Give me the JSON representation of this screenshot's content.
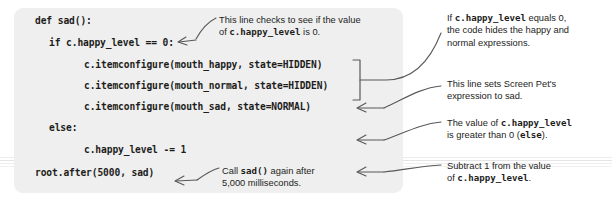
{
  "figure": {
    "type": "annotated-code-listing",
    "background_color": "#ffffff",
    "code_panel_color": "#efefef",
    "text_color": "#1d1d1b"
  },
  "code": {
    "language": "python",
    "lines": [
      "def sad():",
      "    if c.happy_level == 0:",
      "        c.itemconfigure(mouth_happy, state=HIDDEN)",
      "        c.itemconfigure(mouth_normal, state=HIDDEN)",
      "        c.itemconfigure(mouth_sad, state=NORMAL)",
      "    else:",
      "        c.happy_level -= 1",
      "    root.after(5000, sad)"
    ],
    "line1": "def sad():",
    "line2": "if c.happy_level == 0:",
    "line3": "c.itemconfigure(mouth_happy, state=HIDDEN)",
    "line4": "c.itemconfigure(mouth_normal, state=HIDDEN)",
    "line5": "c.itemconfigure(mouth_sad, state=NORMAL)",
    "line6": "else:",
    "line7": "c.happy_level -= 1",
    "line8": "root.after(5000, sad)"
  },
  "annotations": {
    "check": {
      "text_part1": "This line checks to see if the value\nof ",
      "code1": "c.happy_level",
      "text_part2": " is 0.",
      "target_line": 2
    },
    "equals": {
      "text_part1": "If ",
      "code1": "c.happy_level",
      "text_part2": " equals 0,\nthe code hides the happy and\nnormal expressions.",
      "target_lines": "3-4"
    },
    "sets": {
      "text": "This line sets Screen Pet's\nexpression to sad.",
      "target_line": 5
    },
    "greater": {
      "text_part1": "The value of ",
      "code1": "c.happy_level",
      "text_part2": "\nis greater than 0 (",
      "code2": "else",
      "text_part3": ").",
      "target_line": 6
    },
    "call": {
      "text_part1": "Call ",
      "code1": "sad()",
      "text_part2": " again after\n5,000 milliseconds.",
      "target_line": 8
    },
    "subtract": {
      "text_part1": "Subtract 1 from the value\nof ",
      "code1": "c.happy_level",
      "text_part2": ".",
      "target_line": 7
    }
  }
}
